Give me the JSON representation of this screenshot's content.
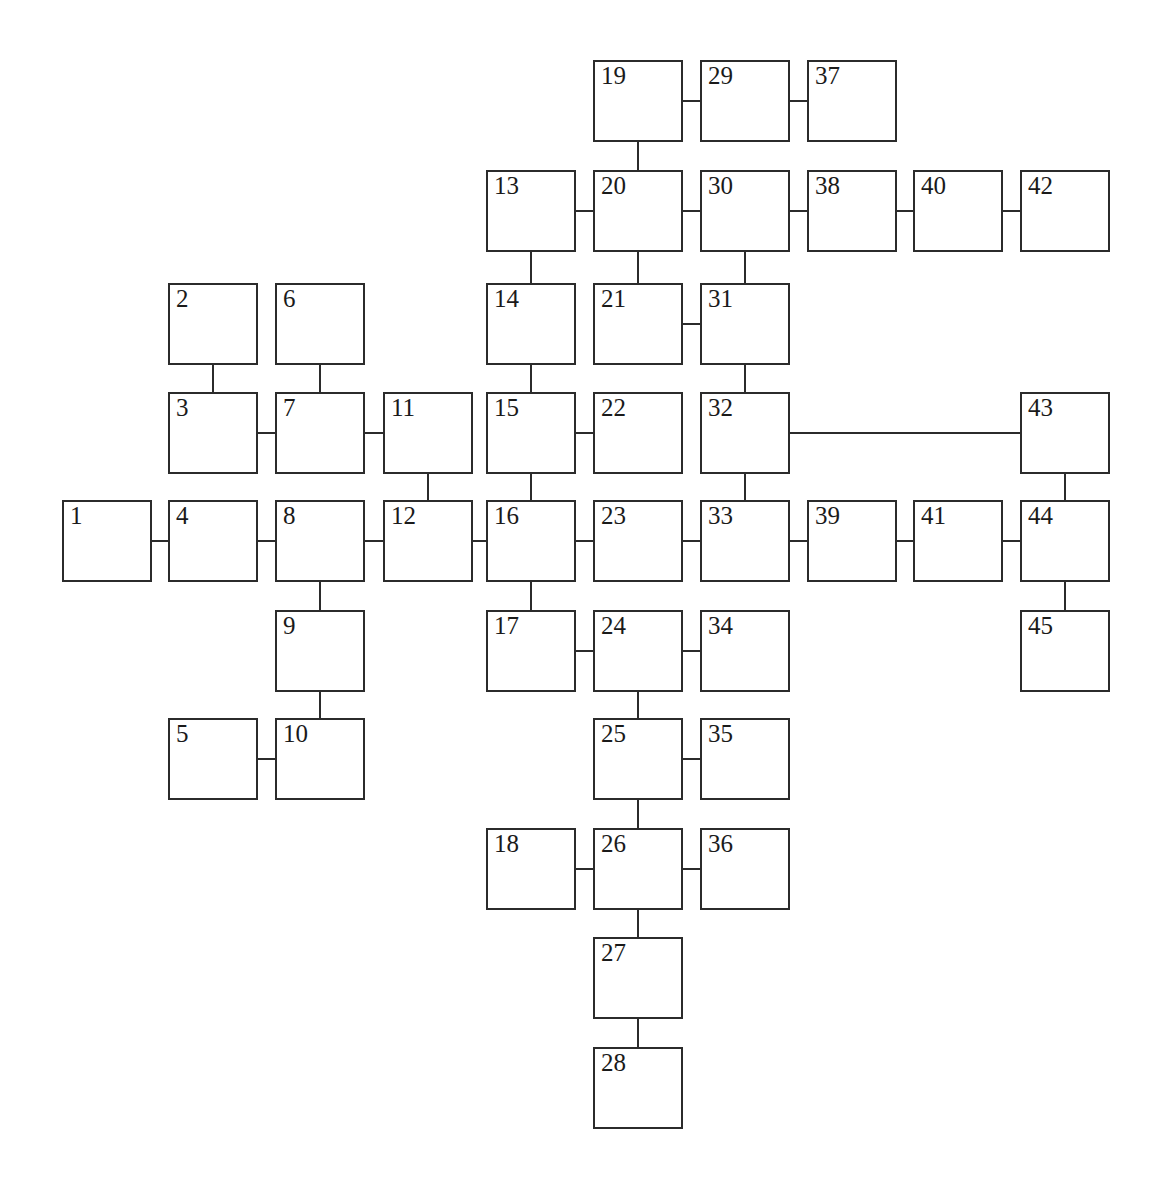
{
  "diagram": {
    "type": "node-link-graph",
    "canvas": {
      "width": 1162,
      "height": 1183,
      "background": "#ffffff"
    },
    "style": {
      "node_fill": "#ffffff",
      "node_stroke": "#2b2b2b",
      "node_stroke_width": 2.2,
      "edge_stroke": "#2b2b2b",
      "edge_stroke_width": 2.2,
      "label_color": "#1a1a1a",
      "node_width": 90,
      "node_height": 82
    },
    "grid": {
      "columns_x": [
        62,
        168,
        275,
        383,
        486,
        593,
        700,
        807,
        913,
        1020
      ],
      "rows_y": [
        60,
        170,
        283,
        392,
        500,
        610,
        718,
        828,
        937,
        1047
      ]
    },
    "nodes": [
      {
        "id": 1,
        "label": "1",
        "col": 0,
        "row": 4
      },
      {
        "id": 2,
        "label": "2",
        "col": 1,
        "row": 2
      },
      {
        "id": 3,
        "label": "3",
        "col": 1,
        "row": 3
      },
      {
        "id": 4,
        "label": "4",
        "col": 1,
        "row": 4
      },
      {
        "id": 5,
        "label": "5",
        "col": 1,
        "row": 6
      },
      {
        "id": 6,
        "label": "6",
        "col": 2,
        "row": 2
      },
      {
        "id": 7,
        "label": "7",
        "col": 2,
        "row": 3
      },
      {
        "id": 8,
        "label": "8",
        "col": 2,
        "row": 4
      },
      {
        "id": 9,
        "label": "9",
        "col": 2,
        "row": 5
      },
      {
        "id": 10,
        "label": "10",
        "col": 2,
        "row": 6
      },
      {
        "id": 11,
        "label": "11",
        "col": 3,
        "row": 3
      },
      {
        "id": 12,
        "label": "12",
        "col": 3,
        "row": 4
      },
      {
        "id": 13,
        "label": "13",
        "col": 4,
        "row": 1
      },
      {
        "id": 14,
        "label": "14",
        "col": 4,
        "row": 2
      },
      {
        "id": 15,
        "label": "15",
        "col": 4,
        "row": 3
      },
      {
        "id": 16,
        "label": "16",
        "col": 4,
        "row": 4
      },
      {
        "id": 17,
        "label": "17",
        "col": 4,
        "row": 5
      },
      {
        "id": 18,
        "label": "18",
        "col": 4,
        "row": 7
      },
      {
        "id": 19,
        "label": "19",
        "col": 5,
        "row": 0
      },
      {
        "id": 20,
        "label": "20",
        "col": 5,
        "row": 1
      },
      {
        "id": 21,
        "label": "21",
        "col": 5,
        "row": 2
      },
      {
        "id": 22,
        "label": "22",
        "col": 5,
        "row": 3
      },
      {
        "id": 23,
        "label": "23",
        "col": 5,
        "row": 4
      },
      {
        "id": 24,
        "label": "24",
        "col": 5,
        "row": 5
      },
      {
        "id": 25,
        "label": "25",
        "col": 5,
        "row": 6
      },
      {
        "id": 26,
        "label": "26",
        "col": 5,
        "row": 7
      },
      {
        "id": 27,
        "label": "27",
        "col": 5,
        "row": 8
      },
      {
        "id": 28,
        "label": "28",
        "col": 5,
        "row": 9
      },
      {
        "id": 29,
        "label": "29",
        "col": 6,
        "row": 0
      },
      {
        "id": 30,
        "label": "30",
        "col": 6,
        "row": 1
      },
      {
        "id": 31,
        "label": "31",
        "col": 6,
        "row": 2
      },
      {
        "id": 32,
        "label": "32",
        "col": 6,
        "row": 3
      },
      {
        "id": 33,
        "label": "33",
        "col": 6,
        "row": 4
      },
      {
        "id": 34,
        "label": "34",
        "col": 6,
        "row": 5
      },
      {
        "id": 35,
        "label": "35",
        "col": 6,
        "row": 6
      },
      {
        "id": 36,
        "label": "36",
        "col": 6,
        "row": 7
      },
      {
        "id": 37,
        "label": "37",
        "col": 7,
        "row": 0
      },
      {
        "id": 38,
        "label": "38",
        "col": 7,
        "row": 1
      },
      {
        "id": 39,
        "label": "39",
        "col": 7,
        "row": 4
      },
      {
        "id": 40,
        "label": "40",
        "col": 8,
        "row": 1
      },
      {
        "id": 41,
        "label": "41",
        "col": 8,
        "row": 4
      },
      {
        "id": 42,
        "label": "42",
        "col": 9,
        "row": 1
      },
      {
        "id": 43,
        "label": "43",
        "col": 9,
        "row": 3
      },
      {
        "id": 44,
        "label": "44",
        "col": 9,
        "row": 4
      },
      {
        "id": 45,
        "label": "45",
        "col": 9,
        "row": 5
      }
    ],
    "edges": [
      {
        "from": 1,
        "to": 4,
        "orientation": "horizontal"
      },
      {
        "from": 4,
        "to": 8,
        "orientation": "horizontal"
      },
      {
        "from": 8,
        "to": 12,
        "orientation": "horizontal"
      },
      {
        "from": 12,
        "to": 16,
        "orientation": "horizontal"
      },
      {
        "from": 16,
        "to": 23,
        "orientation": "horizontal"
      },
      {
        "from": 23,
        "to": 33,
        "orientation": "horizontal"
      },
      {
        "from": 33,
        "to": 39,
        "orientation": "horizontal"
      },
      {
        "from": 39,
        "to": 41,
        "orientation": "horizontal"
      },
      {
        "from": 41,
        "to": 44,
        "orientation": "horizontal"
      },
      {
        "from": 2,
        "to": 3,
        "orientation": "vertical"
      },
      {
        "from": 3,
        "to": 7,
        "orientation": "horizontal"
      },
      {
        "from": 6,
        "to": 7,
        "orientation": "vertical"
      },
      {
        "from": 7,
        "to": 11,
        "orientation": "horizontal"
      },
      {
        "from": 11,
        "to": 12,
        "orientation": "vertical"
      },
      {
        "from": 8,
        "to": 9,
        "orientation": "vertical"
      },
      {
        "from": 9,
        "to": 10,
        "orientation": "vertical"
      },
      {
        "from": 5,
        "to": 10,
        "orientation": "horizontal"
      },
      {
        "from": 13,
        "to": 20,
        "orientation": "horizontal"
      },
      {
        "from": 13,
        "to": 14,
        "orientation": "vertical"
      },
      {
        "from": 14,
        "to": 15,
        "orientation": "vertical"
      },
      {
        "from": 15,
        "to": 22,
        "orientation": "horizontal"
      },
      {
        "from": 15,
        "to": 16,
        "orientation": "vertical"
      },
      {
        "from": 16,
        "to": 17,
        "orientation": "vertical"
      },
      {
        "from": 17,
        "to": 24,
        "orientation": "horizontal"
      },
      {
        "from": 19,
        "to": 29,
        "orientation": "horizontal"
      },
      {
        "from": 29,
        "to": 37,
        "orientation": "horizontal"
      },
      {
        "from": 19,
        "to": 20,
        "orientation": "vertical"
      },
      {
        "from": 20,
        "to": 30,
        "orientation": "horizontal"
      },
      {
        "from": 30,
        "to": 38,
        "orientation": "horizontal"
      },
      {
        "from": 38,
        "to": 40,
        "orientation": "horizontal"
      },
      {
        "from": 40,
        "to": 42,
        "orientation": "horizontal"
      },
      {
        "from": 20,
        "to": 21,
        "orientation": "vertical"
      },
      {
        "from": 21,
        "to": 31,
        "orientation": "horizontal"
      },
      {
        "from": 30,
        "to": 31,
        "orientation": "vertical"
      },
      {
        "from": 31,
        "to": 32,
        "orientation": "vertical"
      },
      {
        "from": 32,
        "to": 43,
        "orientation": "horizontal"
      },
      {
        "from": 32,
        "to": 33,
        "orientation": "vertical"
      },
      {
        "from": 24,
        "to": 34,
        "orientation": "horizontal"
      },
      {
        "from": 24,
        "to": 25,
        "orientation": "vertical"
      },
      {
        "from": 25,
        "to": 35,
        "orientation": "horizontal"
      },
      {
        "from": 25,
        "to": 26,
        "orientation": "vertical"
      },
      {
        "from": 18,
        "to": 26,
        "orientation": "horizontal"
      },
      {
        "from": 26,
        "to": 36,
        "orientation": "horizontal"
      },
      {
        "from": 26,
        "to": 27,
        "orientation": "vertical"
      },
      {
        "from": 27,
        "to": 28,
        "orientation": "vertical"
      },
      {
        "from": 43,
        "to": 44,
        "orientation": "vertical"
      },
      {
        "from": 44,
        "to": 45,
        "orientation": "vertical"
      }
    ]
  }
}
